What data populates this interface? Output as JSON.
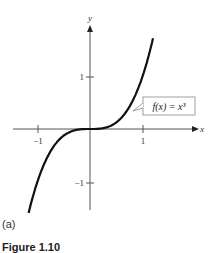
{
  "chart_data": {
    "type": "line",
    "title": "",
    "function_label": "f(x) = x^3",
    "xlabel": "x",
    "ylabel": "y",
    "x_ticks": [
      -1,
      1
    ],
    "y_ticks": [
      1,
      -1
    ],
    "xlim": [
      -1.6,
      1.6
    ],
    "ylim": [
      -1.6,
      2.1
    ],
    "grid": false,
    "series": [
      {
        "name": "f(x) = x^3",
        "x": [
          -1.2,
          -1.0,
          -0.8,
          -0.6,
          -0.4,
          -0.2,
          0,
          0.2,
          0.4,
          0.6,
          0.8,
          1.0,
          1.2
        ],
        "values": [
          -1.728,
          -1.0,
          -0.512,
          -0.216,
          -0.064,
          -0.008,
          0,
          0.008,
          0.064,
          0.216,
          0.512,
          1.0,
          1.728
        ]
      }
    ]
  },
  "labels": {
    "x_axis": "x",
    "y_axis": "y",
    "tick_x_neg1": "−1",
    "tick_x_1": "1",
    "tick_y_1": "1",
    "tick_y_neg1": "−1",
    "callout": "f(x) = x³",
    "caption": "(a)",
    "figure_label": "Figure 1.10"
  }
}
